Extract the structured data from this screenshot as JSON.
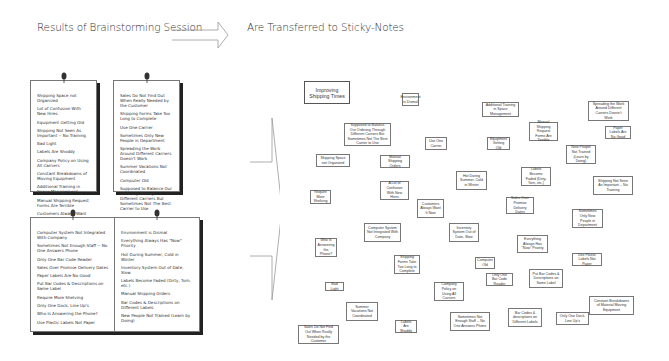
{
  "headings": {
    "left": "Results of Brainstorming Session",
    "right": "Are Transferred to Sticky-Notes"
  },
  "pages": [
    {
      "items": [
        "Shipping Space not Organized",
        "Lot of Confusion With New Hires",
        "Equipment Getting Old",
        "Shipping Not Seen As Important -- No Training",
        "Bad Light",
        "Labels Are Shoddy",
        "Company Policy on Using All Carriers",
        "Constant Breakdowns of Moving Equipment",
        "Additional Training in Space Management",
        "Manual Shipping Request Forms Are Terrible",
        "Customers Always Want It Now"
      ]
    },
    {
      "items": [
        "Sales Do Not Find Out When Really Needed by the Customer",
        "Shipping Forms Take Too Long to Complete",
        "Use One Carrier",
        "Sometimes Only New People in Department",
        "Spreading the Work Around Different Carriers Doesn't Work",
        "Summer Vacations Not Coordinated",
        "Computer Old",
        "Supposed to Balance Our Ordering Through Different Carriers But Sometimes Not The Best Carrier to Use"
      ]
    },
    {
      "items": [
        "Computer System Not Integrated With Company",
        "Sometimes Not Enough Staff -- No One Answers Phone",
        "Only One Bar Code Reader",
        "Sales Over Promise Delivery Dates",
        "Paper Labels Are No Good",
        "Put Bar Codes & Descriptions on Same Label",
        "Require More Shelving",
        "Only One Dock, Line Up's",
        "Who Is Answering the Phone?",
        "Use Plastic Labels Not Paper"
      ]
    },
    {
      "items": [
        "Environment is Dismal",
        "Everything Always Has \"Now\" Priority",
        "Hot During Summer, Cold in Winter",
        "Inventory System Out of Date, Slow",
        "Labels Become Faded (Dirty, Torn, etc.)",
        "Manual Shipping Orders",
        "Bar Codes & Descriptions on Different Labels",
        "New People Not Trained (Learn by Doing)"
      ]
    }
  ],
  "sticky_notes": [
    {
      "text": "Improving Shipping Times",
      "x": 304,
      "y": 81,
      "w": 46,
      "h": 23,
      "title": true
    },
    {
      "text": "Environment is Dismal",
      "x": 402,
      "y": 93,
      "w": 17,
      "h": 13
    },
    {
      "text": "Additional Training in Space Management",
      "x": 482,
      "y": 102,
      "w": 37,
      "h": 15
    },
    {
      "text": "Spreading the Work Around Different Carriers Doesn't Work",
      "x": 588,
      "y": 101,
      "w": 41,
      "h": 20
    },
    {
      "text": "Supposed to Balance Our Ordering Through Different Carriers But Sometimes Not The Best Carrier to Use",
      "x": 344,
      "y": 123,
      "w": 47,
      "h": 23
    },
    {
      "text": "Use One Carrier",
      "x": 425,
      "y": 137,
      "w": 22,
      "h": 13
    },
    {
      "text": "Equipment Getting Old",
      "x": 487,
      "y": 137,
      "w": 23,
      "h": 13
    },
    {
      "text": "Manual Shipping Request Forms Are Terrible",
      "x": 529,
      "y": 122,
      "w": 29,
      "h": 19
    },
    {
      "text": "Paper Labels Are No Good",
      "x": 605,
      "y": 126,
      "w": 26,
      "h": 13
    },
    {
      "text": "Shipping Space not Organized",
      "x": 316,
      "y": 154,
      "w": 34,
      "h": 13
    },
    {
      "text": "Manual Shipping Orders",
      "x": 380,
      "y": 155,
      "w": 30,
      "h": 13
    },
    {
      "text": "New People Not Trained (Learn by Doing)",
      "x": 566,
      "y": 145,
      "w": 30,
      "h": 19
    },
    {
      "text": "Hot During Summer, Cold in Winter",
      "x": 456,
      "y": 171,
      "w": 31,
      "h": 19
    },
    {
      "text": "Labels Become Faded (Dirty, Torn, etc.)",
      "x": 521,
      "y": 167,
      "w": 30,
      "h": 19
    },
    {
      "text": "Shipping Not Seen As Important -- No Training",
      "x": 593,
      "y": 176,
      "w": 40,
      "h": 19
    },
    {
      "text": "Require More Shelving",
      "x": 310,
      "y": 190,
      "w": 21,
      "h": 14
    },
    {
      "text": "A Lot of Confusion With New Hires",
      "x": 380,
      "y": 181,
      "w": 29,
      "h": 19
    },
    {
      "text": "Customers Always Want It Now",
      "x": 417,
      "y": 199,
      "w": 27,
      "h": 19
    },
    {
      "text": "Sales Over Promise Delivery Dates",
      "x": 506,
      "y": 197,
      "w": 28,
      "h": 17
    },
    {
      "text": "Sometimes Only New People in Department",
      "x": 572,
      "y": 209,
      "w": 31,
      "h": 19
    },
    {
      "text": "Computer System Not Integrated With Company",
      "x": 364,
      "y": 223,
      "w": 37,
      "h": 19
    },
    {
      "text": "Inventory System Out of Date, Slow",
      "x": 449,
      "y": 223,
      "w": 30,
      "h": 19
    },
    {
      "text": "Everything Always Has \"Now\" Priority",
      "x": 517,
      "y": 235,
      "w": 31,
      "h": 18
    },
    {
      "text": "Who Is Answering the Phone?",
      "x": 315,
      "y": 238,
      "w": 22,
      "h": 19
    },
    {
      "text": "Shipping Forms Take Too Long to Complete",
      "x": 394,
      "y": 255,
      "w": 26,
      "h": 19
    },
    {
      "text": "Computer Old",
      "x": 475,
      "y": 257,
      "w": 20,
      "h": 12
    },
    {
      "text": "Use Plastic Labels Not Paper",
      "x": 572,
      "y": 253,
      "w": 30,
      "h": 13
    },
    {
      "text": "Only One Bar Code Reader",
      "x": 486,
      "y": 273,
      "w": 27,
      "h": 13
    },
    {
      "text": "Put Bar Codes & Descriptions on Same Label",
      "x": 529,
      "y": 269,
      "w": 34,
      "h": 19
    },
    {
      "text": "Bad Light",
      "x": 325,
      "y": 282,
      "w": 19,
      "h": 9
    },
    {
      "text": "Company Policy on Using All Carriers",
      "x": 434,
      "y": 282,
      "w": 30,
      "h": 19
    },
    {
      "text": "Constant Breakdowns of Material Moving Equipment",
      "x": 589,
      "y": 296,
      "w": 45,
      "h": 19
    },
    {
      "text": "Summer Vacations Not Coordinated",
      "x": 346,
      "y": 302,
      "w": 32,
      "h": 19
    },
    {
      "text": "Bar Codes & descriptions on Different Labels",
      "x": 508,
      "y": 308,
      "w": 34,
      "h": 19
    },
    {
      "text": "Only One Dock, Line Up's",
      "x": 556,
      "y": 312,
      "w": 33,
      "h": 13
    },
    {
      "text": "Sometimes Not Enough Staff -- No One Answers Phone",
      "x": 450,
      "y": 312,
      "w": 40,
      "h": 19
    },
    {
      "text": "Sales Do Not Find Out When Really Needed by the Customer",
      "x": 298,
      "y": 325,
      "w": 41,
      "h": 19
    },
    {
      "text": "Labels Are Shoddy",
      "x": 395,
      "y": 320,
      "w": 22,
      "h": 13
    }
  ],
  "colors": {
    "border": "#777777",
    "text": "#333333",
    "shadow": "#222222",
    "background": "#ffffff"
  }
}
